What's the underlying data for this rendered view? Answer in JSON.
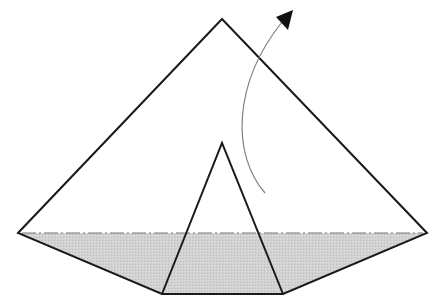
{
  "diagram": {
    "type": "origami-fold-step",
    "width": 443,
    "height": 308,
    "colors": {
      "background": "#ffffff",
      "stroke": "#1a1a1a",
      "fold_fill": "#cfcfcf",
      "arrow_line": "#808080",
      "arrow_head": "#111111",
      "fold_line": "#777777"
    },
    "outer_shape": {
      "label": "kite-pentagon",
      "points": [
        [
          222,
          19
        ],
        [
          427,
          233
        ],
        [
          283,
          294
        ],
        [
          162,
          294
        ],
        [
          18,
          233
        ]
      ]
    },
    "shaded_region": {
      "label": "folded-flap",
      "points": [
        [
          18,
          233
        ],
        [
          427,
          233
        ],
        [
          283,
          294
        ],
        [
          162,
          294
        ]
      ]
    },
    "fold_line": {
      "style": "dash-dot",
      "from": [
        18,
        233
      ],
      "to": [
        427,
        233
      ]
    },
    "inner_triangle": {
      "points": [
        [
          222,
          143
        ],
        [
          162,
          294
        ],
        [
          283,
          294
        ]
      ]
    },
    "fold_arrow": {
      "direction": "up-right",
      "path": "M 265 193 C 232 155, 232 85, 282 22",
      "head": [
        [
          293,
          10
        ],
        [
          276,
          17
        ],
        [
          288,
          30
        ]
      ]
    }
  }
}
